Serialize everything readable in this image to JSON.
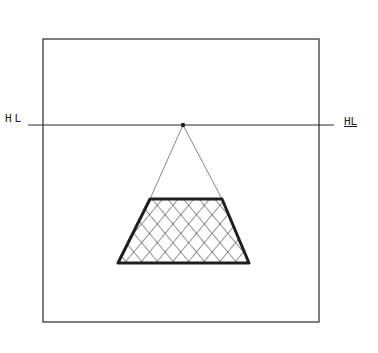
{
  "diagram": {
    "type": "one-point perspective sketch",
    "labels": {
      "horizon_left": "HL",
      "horizon_right": "HL"
    },
    "colors": {
      "ink": "#1e1e1e",
      "background": "#ffffff"
    },
    "elements": [
      "picture frame",
      "horizon line",
      "vanishing point",
      "converging guide lines",
      "cross-hatched trapezoid (floor plane)"
    ]
  }
}
